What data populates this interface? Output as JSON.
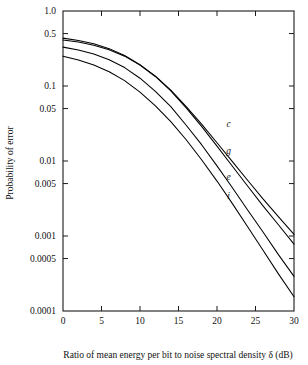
{
  "chart_data": {
    "type": "line",
    "title": "",
    "xlabel": "Ratio of mean energy per bit to noise spectral density δ (dB)",
    "ylabel": "Probability of error",
    "xlim": [
      0,
      30
    ],
    "ylim": [
      0.0001,
      1.0
    ],
    "yscale": "log",
    "grid": false,
    "legend": "inline-curve-labels",
    "xticks": [
      0,
      5,
      10,
      15,
      20,
      25,
      30
    ],
    "xtick_labels": [
      "0",
      "5",
      "10",
      "15",
      "20",
      "25",
      "30"
    ],
    "yticks": [
      1.0,
      0.5,
      0.1,
      0.05,
      0.01,
      0.005,
      0.001,
      0.0005,
      0.0001
    ],
    "ytick_labels": [
      "1.0",
      "0.5",
      "0.1",
      "0.05",
      "0.01",
      "0.005",
      "0.001",
      "0.0005",
      "0.0001"
    ],
    "x": [
      0,
      2,
      4,
      6,
      8,
      10,
      12,
      14,
      16,
      18,
      20,
      22,
      24,
      26,
      28,
      30
    ],
    "series": [
      {
        "name": "c",
        "label": "c",
        "label_x": 21.5,
        "label_y": 0.028,
        "values": [
          0.41,
          0.385,
          0.35,
          0.305,
          0.25,
          0.19,
          0.135,
          0.088,
          0.053,
          0.031,
          0.0175,
          0.0098,
          0.0055,
          0.0031,
          0.0018,
          0.00105
        ]
      },
      {
        "name": "g",
        "label": "g",
        "label_x": 21.5,
        "label_y": 0.0125,
        "values": [
          0.435,
          0.405,
          0.365,
          0.315,
          0.255,
          0.192,
          0.134,
          0.086,
          0.051,
          0.029,
          0.0158,
          0.0085,
          0.0046,
          0.0025,
          0.0014,
          0.00078
        ]
      },
      {
        "name": "e",
        "label": "e",
        "label_x": 21.5,
        "label_y": 0.0056,
        "values": [
          0.33,
          0.302,
          0.267,
          0.224,
          0.176,
          0.127,
          0.085,
          0.053,
          0.03,
          0.0165,
          0.0086,
          0.0044,
          0.0022,
          0.00112,
          0.00056,
          0.00029
        ]
      },
      {
        "name": "i",
        "label": "i",
        "label_x": 21.5,
        "label_y": 0.0031,
        "values": [
          0.25,
          0.222,
          0.19,
          0.155,
          0.118,
          0.083,
          0.0545,
          0.0335,
          0.0192,
          0.0104,
          0.0054,
          0.0027,
          0.00132,
          0.00064,
          0.00031,
          0.000155
        ]
      }
    ]
  }
}
